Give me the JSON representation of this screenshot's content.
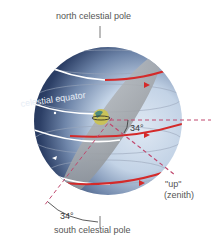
{
  "diagram": {
    "labels": {
      "north_pole": "north celestial pole",
      "south_pole": "south celestial pole",
      "equator": "celestial equator",
      "angle_top": "34°",
      "angle_bottom": "34°",
      "up": "\"up\"",
      "zenith": "(zenith)"
    },
    "colors": {
      "sphere_dark": "#1e2f55",
      "sphere_light": "#c9d7e8",
      "plane": "#9a9ea3",
      "arrow_red": "#d42a2a",
      "path_white": "#ffffff",
      "dashed": "#c0486e",
      "label": "#555555"
    }
  }
}
